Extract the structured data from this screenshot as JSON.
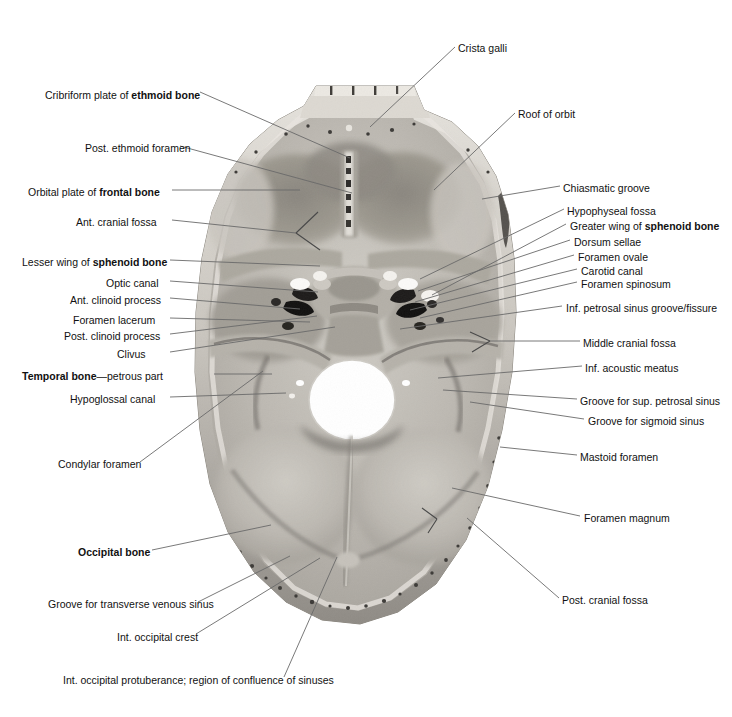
{
  "figure": {
    "background_color": "#ffffff",
    "leader_line_color": "#6a6a6a",
    "bone_light": "#d8d5cf",
    "bone_mid": "#b9b5ae",
    "bone_dark": "#8e8a84",
    "fossa_shadow": "#7d7a75",
    "foramen_magnum_color": "#ffffff"
  },
  "labels_left": [
    {
      "id": "cribriform-plate",
      "text_pre": "Cribriform plate of ",
      "text_bold": "ethmoid bone",
      "text_post": "",
      "x": 45,
      "y": 95
    },
    {
      "id": "post-ethmoid-foramen",
      "text_pre": "Post. ethmoid foramen",
      "text_bold": "",
      "text_post": "",
      "x": 85,
      "y": 148
    },
    {
      "id": "orbital-plate-frontal",
      "text_pre": "Orbital plate of ",
      "text_bold": "frontal bone",
      "text_post": "",
      "x": 28,
      "y": 192
    },
    {
      "id": "ant-cranial-fossa",
      "text_pre": "Ant. cranial fossa",
      "text_bold": "",
      "text_post": "",
      "x": 76,
      "y": 222
    },
    {
      "id": "lesser-wing-sphenoid",
      "text_pre": "Lesser wing of ",
      "text_bold": "sphenoid bone",
      "text_post": "",
      "x": 22,
      "y": 262
    },
    {
      "id": "optic-canal",
      "text_pre": "Optic canal",
      "text_bold": "",
      "text_post": "",
      "x": 106,
      "y": 283
    },
    {
      "id": "ant-clinoid-process",
      "text_pre": "Ant. clinoid process",
      "text_bold": "",
      "text_post": "",
      "x": 70,
      "y": 300
    },
    {
      "id": "foramen-lacerum",
      "text_pre": "Foramen lacerum",
      "text_bold": "",
      "text_post": "",
      "x": 73,
      "y": 320
    },
    {
      "id": "post-clinoid-process",
      "text_pre": "Post. clinoid process",
      "text_bold": "",
      "text_post": "",
      "x": 64,
      "y": 336
    },
    {
      "id": "clivus",
      "text_pre": "Clivus",
      "text_bold": "",
      "text_post": "",
      "x": 117,
      "y": 354
    },
    {
      "id": "temporal-bone-petrous",
      "text_pre": "",
      "text_bold": "Temporal bone",
      "text_post": "—petrous part",
      "x": 22,
      "y": 376
    },
    {
      "id": "hypoglossal-canal",
      "text_pre": "Hypoglossal canal",
      "text_bold": "",
      "text_post": "",
      "x": 70,
      "y": 399
    },
    {
      "id": "condylar-foramen",
      "text_pre": "Condylar foramen",
      "text_bold": "",
      "text_post": "",
      "x": 58,
      "y": 464
    },
    {
      "id": "occipital-bone",
      "text_pre": "",
      "text_bold": "Occipital bone",
      "text_post": "",
      "x": 78,
      "y": 552
    },
    {
      "id": "groove-transverse-sinus",
      "text_pre": "Groove for transverse venous sinus",
      "text_bold": "",
      "text_post": "",
      "x": 48,
      "y": 604
    },
    {
      "id": "int-occipital-crest",
      "text_pre": "Int. occipital crest",
      "text_bold": "",
      "text_post": "",
      "x": 117,
      "y": 637
    },
    {
      "id": "int-occipital-protuberance",
      "text_pre": "Int. occipital protuberance; region of confluence of sinuses",
      "text_bold": "",
      "text_post": "",
      "x": 63,
      "y": 680
    }
  ],
  "labels_right": [
    {
      "id": "crista-galli",
      "text_pre": "Crista galli",
      "text_bold": "",
      "text_post": "",
      "x": 458,
      "y": 48
    },
    {
      "id": "roof-of-orbit",
      "text_pre": "Roof of orbit",
      "text_bold": "",
      "text_post": "",
      "x": 518,
      "y": 114
    },
    {
      "id": "chiasmatic-groove",
      "text_pre": "Chiasmatic groove",
      "text_bold": "",
      "text_post": "",
      "x": 563,
      "y": 188
    },
    {
      "id": "hypophyseal-fossa",
      "text_pre": "Hypophyseal fossa",
      "text_bold": "",
      "text_post": "",
      "x": 567,
      "y": 211
    },
    {
      "id": "greater-wing-sphenoid",
      "text_pre": "Greater wing of ",
      "text_bold": "sphenoid bone",
      "text_post": "",
      "x": 570,
      "y": 226
    },
    {
      "id": "dorsum-sellae",
      "text_pre": "Dorsum sellae",
      "text_bold": "",
      "text_post": "",
      "x": 574,
      "y": 242
    },
    {
      "id": "foramen-ovale",
      "text_pre": "Foramen ovale",
      "text_bold": "",
      "text_post": "",
      "x": 578,
      "y": 257
    },
    {
      "id": "carotid-canal",
      "text_pre": "Carotid canal",
      "text_bold": "",
      "text_post": "",
      "x": 581,
      "y": 271
    },
    {
      "id": "foramen-spinosum",
      "text_pre": "Foramen spinosum",
      "text_bold": "",
      "text_post": "",
      "x": 581,
      "y": 284
    },
    {
      "id": "inf-petrosal-sinus",
      "text_pre": "Inf. petrosal sinus groove/fissure",
      "text_bold": "",
      "text_post": "",
      "x": 566,
      "y": 308
    },
    {
      "id": "middle-cranial-fossa",
      "text_pre": "Middle cranial fossa",
      "text_bold": "",
      "text_post": "",
      "x": 583,
      "y": 343
    },
    {
      "id": "inf-acoustic-meatus",
      "text_pre": "Inf. acoustic meatus",
      "text_bold": "",
      "text_post": "",
      "x": 585,
      "y": 368
    },
    {
      "id": "groove-sup-petrosal",
      "text_pre": "Groove for sup. petrosal sinus",
      "text_bold": "",
      "text_post": "",
      "x": 580,
      "y": 401
    },
    {
      "id": "groove-sigmoid-sinus",
      "text_pre": "Groove for sigmoid sinus",
      "text_bold": "",
      "text_post": "",
      "x": 588,
      "y": 421
    },
    {
      "id": "mastoid-foramen",
      "text_pre": "Mastoid foramen",
      "text_bold": "",
      "text_post": "",
      "x": 580,
      "y": 457
    },
    {
      "id": "foramen-magnum",
      "text_pre": "Foramen magnum",
      "text_bold": "",
      "text_post": "",
      "x": 584,
      "y": 518
    },
    {
      "id": "post-cranial-fossa",
      "text_pre": "Post. cranial fossa",
      "text_bold": "",
      "text_post": "",
      "x": 562,
      "y": 600
    }
  ],
  "leaders_left": [
    {
      "id": "cribriform-plate",
      "path": "M200,92 L350,158"
    },
    {
      "id": "post-ethmoid-foramen",
      "path": "M180,146 L352,193"
    },
    {
      "id": "orbital-plate-frontal",
      "path": "M172,190 L300,190"
    },
    {
      "id": "ant-cranial-fossa",
      "path": "M172,220 L296,233"
    },
    {
      "id": "lesser-wing-sphenoid",
      "path": "M170,260 L320,266"
    },
    {
      "id": "optic-canal",
      "path": "M170,281 L318,292"
    },
    {
      "id": "ant-clinoid-process",
      "path": "M170,298 L300,309"
    },
    {
      "id": "foramen-lacerum",
      "path": "M170,318 L310,322"
    },
    {
      "id": "post-clinoid-process",
      "path": "M170,334 L317,316"
    },
    {
      "id": "clivus",
      "path": "M170,352 L335,327"
    },
    {
      "id": "temporal-bone-petrous",
      "path": "M214,374 L272,374"
    },
    {
      "id": "hypoglossal-canal",
      "path": "M170,397 L286,393"
    },
    {
      "id": "condylar-foramen",
      "path": "M140,462 L263,371"
    },
    {
      "id": "occipital-bone",
      "path": "M152,550 L271,525"
    },
    {
      "id": "groove-transverse-sinus",
      "path": "M198,602 L290,556"
    },
    {
      "id": "int-occipital-crest",
      "path": "M196,634 L320,558"
    },
    {
      "id": "int-occipital-protuberance",
      "path": "M284,677 L337,557"
    }
  ],
  "leaders_right": [
    {
      "id": "crista-galli",
      "path": "M455,47 L370,127"
    },
    {
      "id": "roof-of-orbit",
      "path": "M515,113 L434,190"
    },
    {
      "id": "chiasmatic-groove",
      "path": "M560,186 L482,199"
    },
    {
      "id": "hypophyseal-fossa",
      "path": "M564,209 L420,279"
    },
    {
      "id": "greater-wing-sphenoid",
      "path": "M566,224 L432,295"
    },
    {
      "id": "dorsum-sellae",
      "path": "M570,240 L418,291"
    },
    {
      "id": "foramen-ovale",
      "path": "M574,255 L415,302"
    },
    {
      "id": "carotid-canal",
      "path": "M577,269 L410,310"
    },
    {
      "id": "foramen-spinosum",
      "path": "M577,282 L420,318"
    },
    {
      "id": "inf-petrosal-sinus",
      "path": "M562,306 L400,329"
    },
    {
      "id": "middle-cranial-fossa",
      "path": "M580,341 L490,341"
    },
    {
      "id": "inf-acoustic-meatus",
      "path": "M582,366 L438,378"
    },
    {
      "id": "groove-sup-petrosal",
      "path": "M577,399 L443,390"
    },
    {
      "id": "groove-sigmoid-sinus",
      "path": "M584,419 L470,402"
    },
    {
      "id": "mastoid-foramen",
      "path": "M577,455 L500,447"
    },
    {
      "id": "foramen-magnum",
      "path": "M580,516 L452,488"
    },
    {
      "id": "post-cranial-fossa",
      "path": "M559,598 L467,518"
    }
  ],
  "markers": [
    {
      "id": "ant-cranial-fossa-arrow",
      "path": "M296,233 L318,212 M296,233 L320,250"
    },
    {
      "id": "middle-cranial-fossa-arrow",
      "path": "M490,341 L470,332 M490,341 L472,352"
    },
    {
      "id": "post-cranial-fossa-arrow",
      "path": "M437,519 L422,508 M437,519 L428,533"
    }
  ]
}
